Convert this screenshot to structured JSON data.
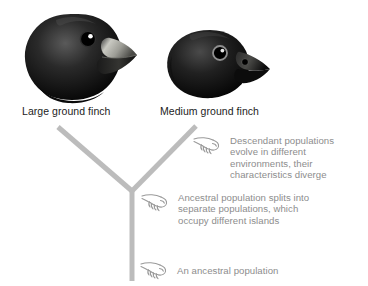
{
  "figure": {
    "background_color": "#ffffff",
    "branch_color": "#bcbcbc",
    "label_color": "#1c1c1c",
    "annotation_color": "#8d8d8d"
  },
  "species": [
    {
      "id": "large-ground-finch",
      "label": "Large ground finch",
      "beak": "large deep beak with pale grey upper mandible",
      "plumage_color": "#111111"
    },
    {
      "id": "medium-ground-finch",
      "label": "Medium ground finch",
      "beak": "smaller pointed black beak",
      "plumage_color": "#121212"
    }
  ],
  "annotations": [
    {
      "id": "descendant-populations",
      "icon": "pointing-hand-icon",
      "text": "Descendant populations\nevolve in different\nenvironments, their\ncharacteristics diverge"
    },
    {
      "id": "ancestral-population-splits",
      "icon": "pointing-hand-icon",
      "text": "Ancestral population splits into\nseparate populations, which\noccupy different islands"
    },
    {
      "id": "an-ancestral-population",
      "icon": "pointing-hand-icon",
      "text": "An ancestral population"
    }
  ],
  "tree": {
    "trunk": {
      "x": 132,
      "y_top": 190,
      "y_bottom": 281,
      "width": 5
    },
    "branches": [
      {
        "id": "left-branch",
        "from": [
          132,
          190
        ],
        "to": [
          57,
          127
        ]
      },
      {
        "id": "right-branch",
        "from": [
          132,
          190
        ],
        "to": [
          197,
          126
        ]
      }
    ]
  }
}
